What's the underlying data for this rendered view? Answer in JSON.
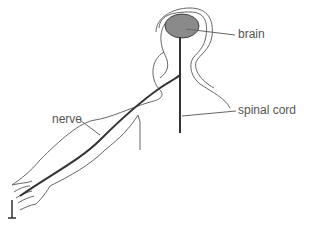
{
  "diagram": {
    "labels": {
      "brain": "brain",
      "spinal_cord": "spinal cord",
      "nerve": "nerve"
    },
    "colors": {
      "brain_fill": "#8a8a8a",
      "outline": "#555555",
      "nerve": "#333333",
      "text": "#555555"
    }
  }
}
